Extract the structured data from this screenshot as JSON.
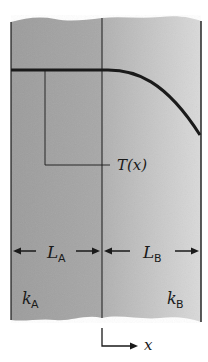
{
  "diagram": {
    "type": "composite-wall-heat-conduction",
    "temperature_label": "T(x)",
    "layers": [
      {
        "name": "A",
        "length_label": "L",
        "length_sub": "A",
        "conductivity_label": "k",
        "conductivity_sub": "A",
        "fill": "#9a9a9a"
      },
      {
        "name": "B",
        "length_label": "L",
        "length_sub": "B",
        "conductivity_label": "k",
        "conductivity_sub": "B",
        "fill": "#c8c8c8"
      }
    ],
    "axis": {
      "label": "x"
    },
    "colors": {
      "line": "#1a1a1a",
      "background": "#ffffff",
      "layer_a": "#9a9a9a",
      "layer_b_left": "#b4b4b4",
      "layer_b_right": "#d8d8d8"
    }
  }
}
